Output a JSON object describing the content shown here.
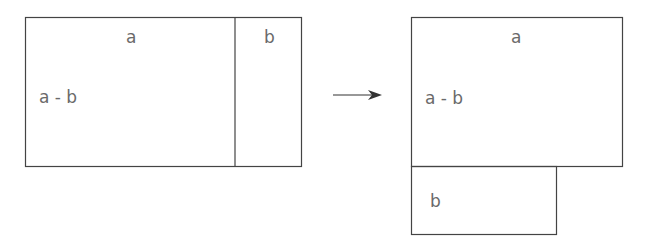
{
  "left_figure": {
    "label_a": "a",
    "label_b": "b",
    "label_a_minus_b": "a - b"
  },
  "arrow": {
    "icon": "right-arrow-icon"
  },
  "right_figure": {
    "label_a": "a",
    "label_a_minus_b": "a - b",
    "label_b": "b"
  },
  "colors": {
    "stroke": "#444444",
    "text": "#6a6a6a"
  }
}
